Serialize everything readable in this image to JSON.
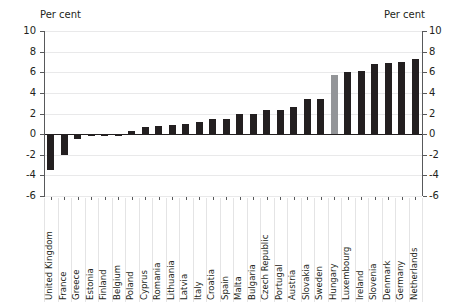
{
  "chart_data": {
    "type": "bar",
    "title": "",
    "subtitle": "",
    "xlabel": "",
    "ylabel": "Per cent",
    "ylabel_right": "Per cent",
    "ylim": [
      -6,
      10
    ],
    "yticks": [
      -6,
      -4,
      -2,
      0,
      2,
      4,
      6,
      8,
      10
    ],
    "ytick_labels": [
      "-6",
      "-4",
      "-2",
      "0",
      "2",
      "4",
      "6",
      "8",
      "10"
    ],
    "grid": true,
    "legend": "none",
    "highlight_category": "Hungary",
    "highlight_color": "#939598",
    "bar_color": "#231f20",
    "categories": [
      "United Kingdom",
      "France",
      "Greece",
      "Estonia",
      "Finland",
      "Belgium",
      "Poland",
      "Cyprus",
      "Romania",
      "Lithuania",
      "Latvia",
      "Italy",
      "Croatia",
      "Spain",
      "Malta",
      "Bulgaria",
      "Czech Republic",
      "Portugal",
      "Austria",
      "Slovakia",
      "Sweden",
      "Hungary",
      "Luxembourg",
      "Ireland",
      "Slovenia",
      "Denmark",
      "Germany",
      "Netherlands"
    ],
    "values": [
      -3.5,
      -2.0,
      -0.5,
      -0.2,
      -0.2,
      -0.2,
      0.3,
      0.7,
      0.8,
      0.85,
      0.95,
      1.15,
      1.45,
      1.45,
      2.0,
      2.0,
      2.3,
      2.3,
      2.6,
      3.4,
      3.4,
      5.7,
      6.05,
      6.15,
      6.8,
      6.9,
      7.0,
      7.3
    ]
  },
  "axes": {
    "unit_left": "Per cent",
    "unit_right": "Per cent"
  }
}
